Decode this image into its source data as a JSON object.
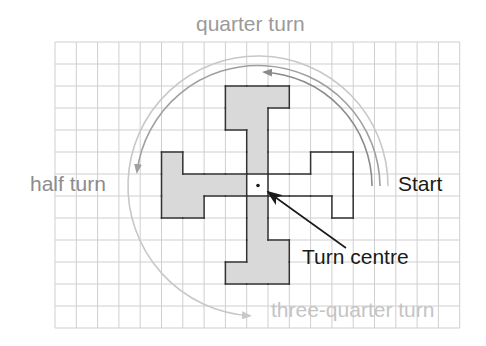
{
  "diagram": {
    "grid": {
      "columns": 19,
      "rows": 13,
      "origin_x": 55,
      "origin_y": 42,
      "cell_width": 21.3,
      "cell_height": 22,
      "line_color": "#cfcfcf"
    },
    "labels": {
      "quarter_turn": "quarter turn",
      "half_turn": "half turn",
      "three_quarter_turn": "three-quarter turn",
      "start": "Start",
      "turn_centre": "Turn centre"
    },
    "colors": {
      "shape_fill": "#d9d9d9",
      "shape_outline": "#333333",
      "quarter_arc": "#8a8a8a",
      "half_arc": "#a0a0a0",
      "three_quarter_arc": "#c8c8c8",
      "pointer": "#1a1a1a"
    },
    "turn_centre": {
      "col": 9,
      "row": 6
    },
    "shapes": [
      {
        "name": "start",
        "filled": false,
        "cells": [
          [
            12,
            5
          ],
          [
            13,
            5
          ],
          [
            10,
            6
          ],
          [
            11,
            6
          ],
          [
            12,
            6
          ],
          [
            13,
            6
          ],
          [
            13,
            7
          ]
        ]
      },
      {
        "name": "quarter-turn",
        "filled": true,
        "cells": [
          [
            8,
            2
          ],
          [
            9,
            2
          ],
          [
            10,
            2
          ],
          [
            8,
            3
          ],
          [
            9,
            3
          ],
          [
            9,
            4
          ],
          [
            9,
            5
          ]
        ]
      },
      {
        "name": "half-turn",
        "filled": true,
        "cells": [
          [
            5,
            5
          ],
          [
            5,
            6
          ],
          [
            6,
            6
          ],
          [
            7,
            6
          ],
          [
            8,
            6
          ],
          [
            5,
            7
          ],
          [
            6,
            7
          ]
        ]
      },
      {
        "name": "three-quarter-turn",
        "filled": true,
        "cells": [
          [
            9,
            7
          ],
          [
            9,
            8
          ],
          [
            9,
            9
          ],
          [
            10,
            9
          ],
          [
            8,
            10
          ],
          [
            9,
            10
          ],
          [
            10,
            10
          ]
        ]
      }
    ]
  }
}
